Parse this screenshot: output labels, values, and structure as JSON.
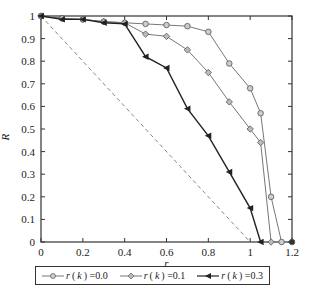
{
  "chart_data": {
    "type": "line",
    "title": "",
    "xlabel": "r",
    "ylabel": "R",
    "xlim": [
      0,
      1.2
    ],
    "ylim": [
      0,
      1
    ],
    "xticks": [
      "0",
      "0.2",
      "0.4",
      "0.6",
      "0.8",
      "1",
      "1.2"
    ],
    "yticks": [
      "0",
      "0.1",
      "0.2",
      "0.3",
      "0.4",
      "0.5",
      "0.6",
      "0.7",
      "0.8",
      "0.9",
      "1"
    ],
    "grid": false,
    "legend_position": "bottom",
    "reference_line": {
      "style": "dashed",
      "x": [
        0,
        1
      ],
      "y": [
        1,
        0
      ]
    },
    "series": [
      {
        "name": "r (k) =0.0",
        "marker": "circle",
        "color": "#777777",
        "x": [
          0,
          0.1,
          0.2,
          0.3,
          0.4,
          0.5,
          0.6,
          0.7,
          0.8,
          0.9,
          1.0,
          1.05,
          1.1,
          1.15
        ],
        "y": [
          1,
          0.99,
          0.985,
          0.975,
          0.97,
          0.965,
          0.96,
          0.955,
          0.93,
          0.79,
          0.68,
          0.57,
          0.2,
          0
        ]
      },
      {
        "name": "r (k) =0.1",
        "marker": "diamond",
        "color": "#777777",
        "x": [
          0,
          0.1,
          0.2,
          0.3,
          0.4,
          0.5,
          0.6,
          0.7,
          0.8,
          0.9,
          1.0,
          1.05,
          1.1
        ],
        "y": [
          1,
          0.99,
          0.985,
          0.975,
          0.97,
          0.92,
          0.91,
          0.85,
          0.75,
          0.62,
          0.5,
          0.44,
          0
        ]
      },
      {
        "name": "r (k) =0.3",
        "marker": "triangle-left",
        "color": "#222222",
        "x": [
          0,
          0.1,
          0.2,
          0.3,
          0.4,
          0.5,
          0.6,
          0.7,
          0.8,
          0.9,
          1.0,
          1.05
        ],
        "y": [
          1,
          0.985,
          0.985,
          0.97,
          0.965,
          0.82,
          0.77,
          0.59,
          0.47,
          0.31,
          0.15,
          0
        ]
      },
      {
        "name": "extra point",
        "marker": "circle",
        "color": "#222222",
        "x": [
          1.2
        ],
        "y": [
          0
        ]
      }
    ]
  },
  "legend": {
    "items": [
      {
        "prefix": "r",
        "label": " (",
        "k": "k",
        "suffix": ") =0.0"
      },
      {
        "prefix": "r",
        "label": " (",
        "k": "k",
        "suffix": ") =0.1"
      },
      {
        "prefix": "r",
        "label": " (",
        "k": "k",
        "suffix": ") =0.3"
      }
    ]
  }
}
